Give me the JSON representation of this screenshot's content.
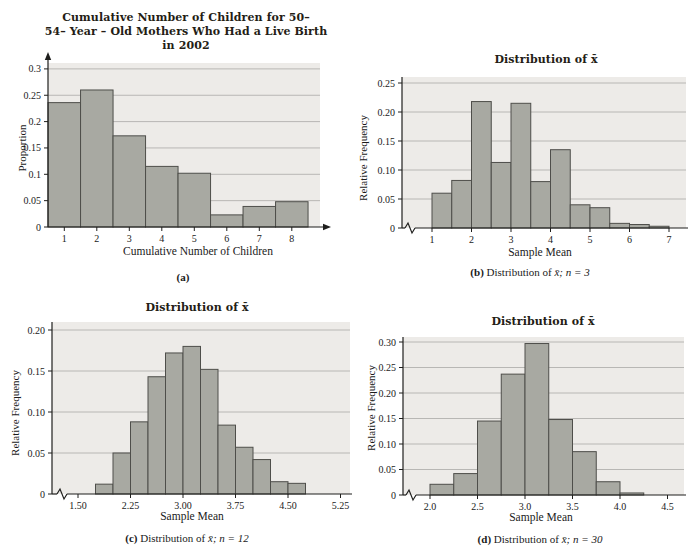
{
  "page": {
    "background": "#ffffff"
  },
  "colors": {
    "plot_bg": "#edebe8",
    "grid": "#b8b7b4",
    "bar_fill": "#a8a9a2",
    "bar_stroke": "#4e4e4a",
    "axis": "#1f1f1d",
    "text": "#1a1a1a",
    "title": "#241d15"
  },
  "chart_data": [
    {
      "id": "a",
      "type": "bar",
      "title": "Cumulative Number of Children for 50–54– Year – Old Mothers Who Had a Live Birth in 2002",
      "title_lines": [
        "Cumulative Number of Children for 50–",
        "54– Year – Old Mothers Who Had a Live Birth",
        "in 2002"
      ],
      "xlabel": "Cumulative Number of Children",
      "ylabel": "Proportion",
      "caption": {
        "bold": "(a)",
        "text": "",
        "math": ""
      },
      "x_ticks": [
        {
          "v": 1,
          "label": "1"
        },
        {
          "v": 2,
          "label": "2"
        },
        {
          "v": 3,
          "label": "3"
        },
        {
          "v": 4,
          "label": "4"
        },
        {
          "v": 5,
          "label": "5"
        },
        {
          "v": 6,
          "label": "6"
        },
        {
          "v": 7,
          "label": "7"
        },
        {
          "v": 8,
          "label": "8"
        }
      ],
      "y_ticks": [
        {
          "v": 0,
          "label": "0"
        },
        {
          "v": 0.05,
          "label": "0.05"
        },
        {
          "v": 0.1,
          "label": "0.1"
        },
        {
          "v": 0.15,
          "label": "0.15"
        },
        {
          "v": 0.2,
          "label": "0.2"
        },
        {
          "v": 0.25,
          "label": "0.25"
        },
        {
          "v": 0.3,
          "label": "0.3"
        }
      ],
      "ylim": [
        0,
        0.31
      ],
      "bars": {
        "bin_start": 0.5,
        "bin_width": 1,
        "values": [
          0.236,
          0.26,
          0.173,
          0.115,
          0.102,
          0.023,
          0.039,
          0.048
        ]
      },
      "axis_break": false,
      "arrows": true,
      "grid": true,
      "legend": "none"
    },
    {
      "id": "b",
      "type": "bar",
      "title": "Distribution of x̄",
      "xlabel": "Sample Mean",
      "ylabel": "Relative Frequency",
      "caption": {
        "bold": "(b)",
        "text": "Distribution of",
        "math": "x̄; n = 3"
      },
      "x_ticks": [
        {
          "v": 1,
          "label": "1"
        },
        {
          "v": 2,
          "label": "2"
        },
        {
          "v": 3,
          "label": "3"
        },
        {
          "v": 4,
          "label": "4"
        },
        {
          "v": 5,
          "label": "5"
        },
        {
          "v": 6,
          "label": "6"
        },
        {
          "v": 7,
          "label": "7"
        }
      ],
      "y_ticks": [
        {
          "v": 0,
          "label": "0"
        },
        {
          "v": 0.05,
          "label": "0.05"
        },
        {
          "v": 0.1,
          "label": "0.10"
        },
        {
          "v": 0.15,
          "label": "0.15"
        },
        {
          "v": 0.2,
          "label": "0.20"
        },
        {
          "v": 0.25,
          "label": "0.25"
        }
      ],
      "ylim": [
        0,
        0.26
      ],
      "bars": {
        "bin_start": 1,
        "bin_width": 0.5,
        "values": [
          0.06,
          0.082,
          0.218,
          0.113,
          0.215,
          0.08,
          0.135,
          0.04,
          0.035,
          0.008,
          0.006,
          0.003
        ]
      },
      "axis_break": true,
      "arrows": false,
      "grid": true,
      "legend": "none"
    },
    {
      "id": "c",
      "type": "bar",
      "title": "Distribution of x̄",
      "xlabel": "Sample Mean",
      "ylabel": "Relative Frequency",
      "caption": {
        "bold": "(c)",
        "text": "Distribution of",
        "math": "x̄; n = 12"
      },
      "x_ticks": [
        {
          "v": 1.5,
          "label": "1.50"
        },
        {
          "v": 2.25,
          "label": "2.25"
        },
        {
          "v": 3.0,
          "label": "3.00"
        },
        {
          "v": 3.75,
          "label": "3.75"
        },
        {
          "v": 4.5,
          "label": "4.50"
        },
        {
          "v": 5.25,
          "label": "5.25"
        }
      ],
      "y_ticks": [
        {
          "v": 0,
          "label": "0"
        },
        {
          "v": 0.05,
          "label": "0.05"
        },
        {
          "v": 0.1,
          "label": "0.10"
        },
        {
          "v": 0.15,
          "label": "0.15"
        },
        {
          "v": 0.2,
          "label": "0.20"
        }
      ],
      "ylim": [
        0,
        0.21
      ],
      "bars": {
        "bin_start": 1.75,
        "bin_width": 0.25,
        "values": [
          0.012,
          0.05,
          0.088,
          0.143,
          0.172,
          0.18,
          0.152,
          0.084,
          0.057,
          0.042,
          0.015,
          0.013
        ]
      },
      "axis_break": true,
      "arrows": false,
      "grid": true,
      "legend": "none"
    },
    {
      "id": "d",
      "type": "bar",
      "title": "Distribution of x̄",
      "xlabel": "Sample Mean",
      "ylabel": "Relative Frequency",
      "caption": {
        "bold": "(d)",
        "text": "Distribution of",
        "math": "x̄; n = 30"
      },
      "x_ticks": [
        {
          "v": 2.0,
          "label": "2.0"
        },
        {
          "v": 2.5,
          "label": "2.5"
        },
        {
          "v": 3.0,
          "label": "3.0"
        },
        {
          "v": 3.5,
          "label": "3.5"
        },
        {
          "v": 4.0,
          "label": "4.0"
        },
        {
          "v": 4.5,
          "label": "4.5"
        }
      ],
      "y_ticks": [
        {
          "v": 0,
          "label": "0"
        },
        {
          "v": 0.05,
          "label": "0.05"
        },
        {
          "v": 0.1,
          "label": "0.10"
        },
        {
          "v": 0.15,
          "label": "0.15"
        },
        {
          "v": 0.2,
          "label": "0.20"
        },
        {
          "v": 0.25,
          "label": "0.25"
        },
        {
          "v": 0.3,
          "label": "0.30"
        }
      ],
      "ylim": [
        0,
        0.31
      ],
      "bars": {
        "bin_start": 2.0,
        "bin_width": 0.25,
        "values": [
          0.021,
          0.042,
          0.145,
          0.237,
          0.297,
          0.148,
          0.085,
          0.026,
          0.004
        ]
      },
      "axis_break": true,
      "arrows": false,
      "grid": true,
      "legend": "none"
    }
  ]
}
